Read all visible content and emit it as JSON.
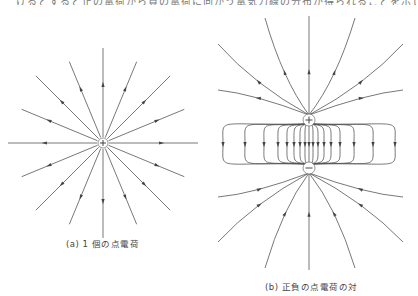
{
  "header": {
    "cut_text": "けるとすると正の電荷から負の電荷に向かう電気力線の分布が得られることを示しています。"
  },
  "figure_a": {
    "caption": "(a)  1 個の点電荷",
    "charge": {
      "sign": "+",
      "x": 103,
      "y": 143
    },
    "line_count": 16,
    "direction": "outward"
  },
  "figure_b": {
    "caption": "(b)  正負の点電荷の対",
    "positive_charge": {
      "sign": "+",
      "x": 309,
      "y": 120
    },
    "negative_charge": {
      "sign": "−",
      "x": 309,
      "y": 168
    },
    "direction": "from positive to negative"
  },
  "colors": {
    "line": "#555555",
    "background": "#ffffff"
  }
}
